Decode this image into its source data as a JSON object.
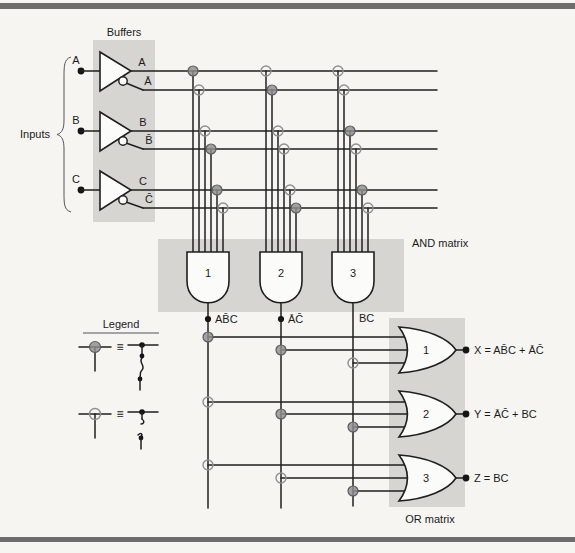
{
  "figure": {
    "buffers_label": "Buffers",
    "inputs_label": "Inputs",
    "and_matrix_label": "AND matrix",
    "or_matrix_label": "OR matrix"
  },
  "inputs": [
    "A",
    "B",
    "C"
  ],
  "buffers": [
    {
      "out": "A",
      "inv": "Ā"
    },
    {
      "out": "B",
      "inv": "B̄"
    },
    {
      "out": "C",
      "inv": "C̄"
    }
  ],
  "and_matrix": {
    "row_labels": [
      "A",
      "Ā",
      "B",
      "B̄",
      "C",
      "C̄"
    ],
    "gates": [
      {
        "num": "1",
        "product": "AB̄C"
      },
      {
        "num": "2",
        "product": "ĀC̄"
      },
      {
        "num": "3",
        "product": "BC"
      }
    ],
    "fuses": [
      [
        "intact",
        "blown",
        "blown",
        "intact",
        "intact",
        "blown"
      ],
      [
        "blown",
        "intact",
        "blown",
        "blown",
        "blown",
        "intact"
      ],
      [
        "blown",
        "blown",
        "intact",
        "blown",
        "intact",
        "blown"
      ]
    ]
  },
  "or_matrix": {
    "gates": [
      {
        "num": "1",
        "output": "X",
        "equation": "X = AB̄C + ĀC̄"
      },
      {
        "num": "2",
        "output": "Y",
        "equation": "Y = ĀC̄ + BC"
      },
      {
        "num": "3",
        "output": "Z",
        "equation": "Z = BC"
      }
    ],
    "fuses": [
      [
        "intact",
        "intact",
        "blown"
      ],
      [
        "blown",
        "intact",
        "intact"
      ],
      [
        "blown",
        "blown",
        "intact"
      ]
    ]
  },
  "legend": {
    "title": "Legend",
    "equiv": "≡",
    "states": [
      "intact",
      "blown"
    ]
  },
  "colors": {
    "band": "#d6d5d2",
    "wire": "#1f1f1f",
    "intact_fuse": "#8f8f8f",
    "frame_bar": "#6d6d6d"
  }
}
